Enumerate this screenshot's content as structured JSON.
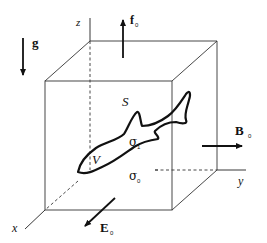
{
  "axes": {
    "x": "x",
    "y": "y",
    "z": "z"
  },
  "vectors": {
    "gravity": {
      "symbol": "g",
      "direction": "down"
    },
    "force": {
      "symbol": "f",
      "subscript": "0",
      "direction": "up"
    },
    "magnetic_field": {
      "symbol": "B",
      "subscript": "0",
      "direction": "+y"
    },
    "electric_field": {
      "symbol": "E",
      "subscript": "0",
      "direction": "+x"
    }
  },
  "regions": {
    "surface": "S",
    "volume": "V",
    "inner_conductivity": {
      "symbol": "σ",
      "subscript": "1"
    },
    "outer_conductivity": {
      "symbol": "σ",
      "subscript": "0"
    }
  },
  "colors": {
    "ink": "#111111",
    "background": "#ffffff"
  }
}
